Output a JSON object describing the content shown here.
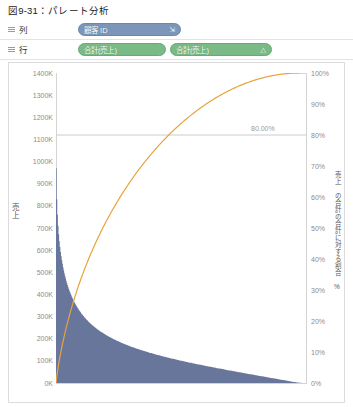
{
  "figure": {
    "caption": "図9-31：パレート分析"
  },
  "shelves": [
    {
      "name": "columns",
      "label": "列",
      "icon": "grid-icon",
      "pills": [
        {
          "label": "顧客 ID",
          "color": "#7b96b8",
          "icon": "sort-descending-icon",
          "icon_glyph": "⇲"
        }
      ]
    },
    {
      "name": "rows",
      "label": "行",
      "icon": "grid-icon",
      "pills": [
        {
          "label": "合計(売上)",
          "color": "#79ba86",
          "icon": "none",
          "icon_glyph": ""
        },
        {
          "label": "合計(売上)",
          "color": "#79ba86",
          "icon": "table-calculation-icon",
          "icon_glyph": "△"
        }
      ]
    }
  ],
  "chart_data": {
    "type": "bar",
    "title": "",
    "subtitle": "",
    "xlabel": "顧客 ID",
    "ylabel": "売上",
    "y2label": "売上 の合計の合計に対する割合 %",
    "grid": false,
    "legend_position": "none",
    "ylim": [
      0,
      1400000
    ],
    "y2lim": [
      0,
      1
    ],
    "y_ticks": [
      "0K",
      "100K",
      "200K",
      "300K",
      "400K",
      "500K",
      "600K",
      "700K",
      "800K",
      "900K",
      "1000K",
      "1100K",
      "1200K",
      "1300K",
      "1400K"
    ],
    "y_tick_values": [
      0,
      100000,
      200000,
      300000,
      400000,
      500000,
      600000,
      700000,
      800000,
      900000,
      1000000,
      1100000,
      1200000,
      1300000,
      1400000
    ],
    "y2_ticks": [
      "0%",
      "10%",
      "20%",
      "30%",
      "40%",
      "50%",
      "60%",
      "70%",
      "80%",
      "90%",
      "100%"
    ],
    "y2_tick_values": [
      0,
      0.1,
      0.2,
      0.3,
      0.4,
      0.5,
      0.6,
      0.7,
      0.8,
      0.9,
      1.0
    ],
    "bar_color": "#68769b",
    "line_color": "#e8a33d",
    "reference_line": {
      "label": "80.00%",
      "value": 0.8,
      "axis": "secondary",
      "color": "#cccccc"
    },
    "x_tick_labels": [],
    "series": [
      {
        "name": "合計(売上)",
        "type": "bar",
        "axis": "primary",
        "values": [
          970000,
          830000,
          760000,
          710000,
          672000,
          640000,
          614000,
          592000,
          572000,
          554000,
          538000,
          523000,
          509000,
          496000,
          484000,
          473000,
          462000,
          452000,
          443000,
          434000,
          426000,
          418000,
          410000,
          403000,
          396000,
          389000,
          383000,
          377000,
          371000,
          365000,
          360000,
          355000,
          350000,
          345000,
          340000,
          336000,
          331000,
          327000,
          323000,
          319000,
          315000,
          311000,
          308000,
          304000,
          301000,
          297000,
          294000,
          291000,
          288000,
          285000,
          282000,
          279000,
          276000,
          273000,
          271000,
          268000,
          265000,
          263000,
          260000,
          258000,
          256000,
          253000,
          251000,
          249000,
          247000,
          244000,
          242000,
          240000,
          238000,
          236000,
          234000,
          232000,
          230000,
          229000,
          227000,
          225000,
          223000,
          221000,
          220000,
          218000,
          216000,
          215000,
          213000,
          211000,
          210000,
          208000,
          207000,
          205000,
          204000,
          202000,
          201000,
          199000,
          198000,
          196000,
          195000,
          194000,
          192000,
          191000,
          190000,
          188000,
          187000,
          186000,
          185000,
          183000,
          182000,
          181000,
          180000,
          178000,
          177000,
          176000,
          175000,
          174000,
          173000,
          172000,
          170000,
          169000,
          168000,
          167000,
          166000,
          165000,
          164000,
          163000,
          162000,
          161000,
          160000,
          159000,
          158000,
          157000,
          156000,
          155000,
          154000,
          153000,
          152000,
          151000,
          150000,
          149000,
          148000,
          148000,
          147000,
          146000,
          145000,
          144000,
          143000,
          142000,
          141000,
          141000,
          140000,
          139000,
          138000,
          137000,
          136000,
          136000,
          135000,
          134000,
          133000,
          132000,
          132000,
          131000,
          130000,
          129000,
          128000,
          128000,
          127000,
          126000,
          125000,
          125000,
          124000,
          123000,
          122000,
          122000,
          121000,
          120000,
          119000,
          119000,
          118000,
          117000,
          116000,
          116000,
          115000,
          114000,
          114000,
          113000,
          112000,
          112000,
          111000,
          110000,
          110000,
          109000,
          108000,
          108000,
          107000,
          106000,
          106000,
          105000,
          104000,
          104000,
          103000,
          102000,
          102000,
          101000,
          100000,
          100000,
          99000,
          98000,
          98000,
          97000,
          97000,
          96000,
          95000,
          95000,
          94000,
          94000,
          93000,
          92000,
          92000,
          91000,
          91000,
          90000,
          89000,
          89000,
          88000,
          88000,
          87000,
          86000,
          86000,
          85000,
          85000,
          84000,
          84000,
          83000,
          82000,
          82000,
          81000,
          81000,
          80000,
          80000,
          79000,
          78000,
          78000,
          77000,
          77000,
          76000,
          76000,
          75000,
          75000,
          74000,
          73000,
          73000,
          72000,
          72000,
          71000,
          71000,
          70000,
          70000,
          69000,
          69000,
          68000,
          67000,
          67000,
          66000,
          66000,
          65000,
          65000,
          64000,
          64000,
          63000,
          63000,
          62000,
          62000,
          61000,
          61000,
          60000,
          59000,
          59000,
          58000,
          58000,
          57000,
          57000,
          56000,
          56000,
          55000,
          55000,
          54000,
          54000,
          53000,
          53000,
          52000,
          52000,
          51000,
          51000,
          50000,
          50000,
          49000,
          48000,
          48000,
          47000,
          47000,
          46000,
          46000,
          45000,
          45000,
          44000,
          44000,
          43000,
          43000,
          42000,
          42000,
          41000,
          41000,
          40000,
          40000,
          39000,
          39000,
          38000,
          38000,
          37000,
          37000,
          36000,
          36000,
          35000,
          35000,
          34000,
          34000,
          33000,
          33000,
          32000,
          32000,
          31000,
          31000,
          30000,
          30000,
          29000,
          29000,
          28000,
          28000,
          27000,
          27000,
          26000,
          26000,
          25000,
          25000,
          24000,
          24000,
          23000,
          23000,
          22000,
          22000,
          21000,
          21000,
          20000,
          20000,
          19000,
          19000,
          18000,
          18000,
          17000,
          17000,
          16000,
          16000,
          15000,
          15000,
          14000,
          14000,
          13000,
          13000,
          12000,
          12000,
          11000,
          11000,
          10000,
          10000,
          9000,
          9000,
          8000,
          8000,
          7000,
          7000,
          6000,
          6000,
          5000,
          5000,
          4000,
          4000,
          3000,
          3000,
          2500,
          2200,
          1900,
          1600,
          1300,
          1100,
          900,
          700,
          500,
          400,
          300,
          200,
          150,
          100,
          60
        ]
      },
      {
        "name": "合計(売上) の累計パーセント",
        "type": "line",
        "axis": "secondary",
        "values": []
      }
    ]
  }
}
